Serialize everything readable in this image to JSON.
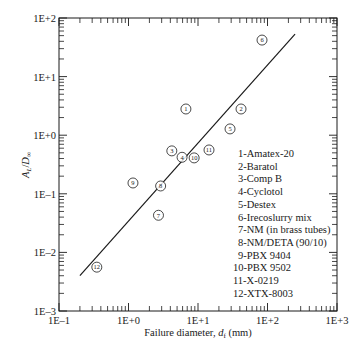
{
  "chart_data": {
    "type": "scatter",
    "title": "",
    "xlabel": "Failure diameter, d_f (mm)",
    "xlabel_parts": {
      "prefix": "Failure diameter, ",
      "var": "d",
      "sub": "f",
      "suffix": " (mm)"
    },
    "ylabel": "A_L/D_∞",
    "ylabel_parts": {
      "a": "A",
      "a_sub": "L",
      "slash": "/",
      "d": "D",
      "d_sub": "∞"
    },
    "xscale": "log",
    "yscale": "log",
    "xlim": [
      0.1,
      1000
    ],
    "ylim": [
      0.001,
      100
    ],
    "x_ticks": [
      "1E–1",
      "1E+0",
      "1E+1",
      "1E+2",
      "1E+3"
    ],
    "y_ticks": [
      "1E+2",
      "1E+1",
      "1E+0",
      "1E–1",
      "1E–2",
      "1E–3"
    ],
    "grid": false,
    "points": [
      {
        "id": "1",
        "name": "Amatex-20",
        "x": 6.7,
        "y": 2.8
      },
      {
        "id": "2",
        "name": "Baratol",
        "x": 41.6,
        "y": 2.8
      },
      {
        "id": "3",
        "name": "Comp B",
        "x": 4.2,
        "y": 0.54
      },
      {
        "id": "4",
        "name": "Cyclotol",
        "x": 5.9,
        "y": 0.42
      },
      {
        "id": "5",
        "name": "Destex",
        "x": 28.9,
        "y": 1.28
      },
      {
        "id": "6",
        "name": "Irecoslurry mix",
        "x": 83.4,
        "y": 42
      },
      {
        "id": "7",
        "name": "NM (in brass tubes)",
        "x": 2.7,
        "y": 0.043
      },
      {
        "id": "8",
        "name": "NM/DETA (90/10)",
        "x": 2.9,
        "y": 0.136
      },
      {
        "id": "9",
        "name": "PBX 9404",
        "x": 1.16,
        "y": 0.153
      },
      {
        "id": "10",
        "name": "PBX 9502",
        "x": 8.8,
        "y": 0.41
      },
      {
        "id": "11",
        "name": "X-0219",
        "x": 14.4,
        "y": 0.56
      },
      {
        "id": "12",
        "name": "XTX-8003",
        "x": 0.35,
        "y": 0.0056
      }
    ],
    "fit_line": {
      "x": [
        0.2,
        249
      ],
      "y": [
        0.004,
        53
      ]
    },
    "legend": {
      "position": "lower right inside plot",
      "entries": [
        "1-Amatex-20",
        "2-Baratol",
        "3-Comp B",
        "4-Cyclotol",
        "5-Destex",
        "6-Irecoslurry mix",
        "7-NM (in brass tubes)",
        "8-NM/DETA (90/10)",
        "9-PBX 9404",
        "10-PBX 9502",
        "11-X-0219",
        "12-XTX-8003"
      ]
    }
  }
}
